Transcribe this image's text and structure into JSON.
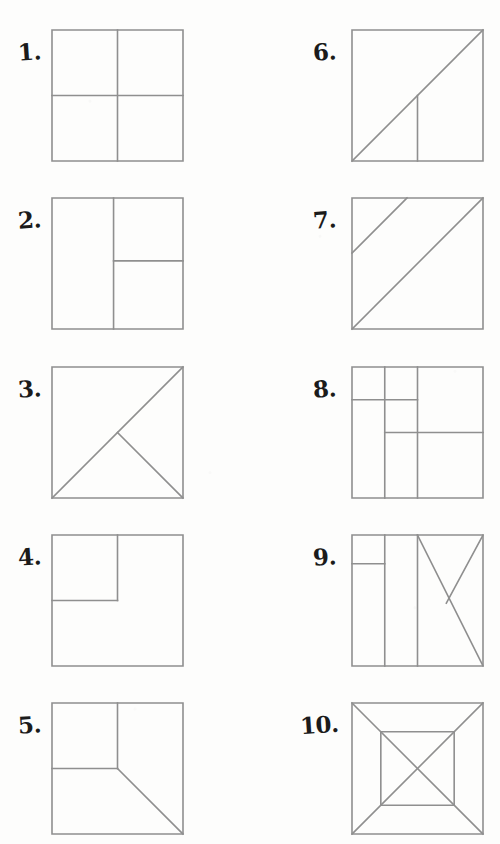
{
  "page": {
    "background_color": "#fdfdfc",
    "line_color": "#8f8f8f",
    "number_ink_color": "#1b1b1b",
    "width": 500,
    "height": 844
  },
  "layout": {
    "columns": 2,
    "rows": 5,
    "square_size": 131,
    "left_column_square_x": 52,
    "right_column_square_x": 352,
    "row_y_positions": [
      30,
      198,
      367,
      535,
      703
    ]
  },
  "problems": [
    {
      "number": "1.",
      "name": "square-quartered",
      "column": "left",
      "row": 0,
      "number_x": 18,
      "number_y": 40,
      "square": {
        "x": 52,
        "y": 30,
        "size": 131
      },
      "description": "Square divided into four equal quadrants",
      "lines": [
        {
          "name": "vertical-center",
          "x1": 50,
          "y1": 0,
          "x2": 50,
          "y2": 100
        },
        {
          "name": "horizontal-center",
          "x1": 0,
          "y1": 50,
          "x2": 100,
          "y2": 50
        }
      ]
    },
    {
      "number": "2.",
      "name": "square-left-half-right-split",
      "column": "left",
      "row": 1,
      "number_x": 18,
      "number_y": 208,
      "square": {
        "x": 52,
        "y": 198,
        "size": 131
      },
      "description": "Square with vertical line near center; right portion split horizontally",
      "lines": [
        {
          "name": "vertical-divider",
          "x1": 47,
          "y1": 0,
          "x2": 47,
          "y2": 100
        },
        {
          "name": "horizontal-right-half",
          "x1": 47,
          "y1": 48,
          "x2": 100,
          "y2": 48
        }
      ]
    },
    {
      "number": "3.",
      "name": "square-diagonal-with-triangle",
      "column": "left",
      "row": 2,
      "number_x": 18,
      "number_y": 377,
      "square": {
        "x": 52,
        "y": 367,
        "size": 131
      },
      "description": "Diagonal from bottom-left to top-right plus segment from its midpoint to bottom-right corner",
      "lines": [
        {
          "name": "main-diagonal",
          "x1": 0,
          "y1": 100,
          "x2": 100,
          "y2": 0
        },
        {
          "name": "midpoint-to-corner",
          "x1": 50,
          "y1": 50,
          "x2": 100,
          "y2": 100
        }
      ]
    },
    {
      "number": "4.",
      "name": "square-with-corner-square",
      "column": "left",
      "row": 3,
      "number_x": 18,
      "number_y": 545,
      "square": {
        "x": 52,
        "y": 535,
        "size": 131
      },
      "description": "Square with a smaller square drawn in the top-left corner",
      "lines": [
        {
          "name": "inner-square-right-edge",
          "x1": 50,
          "y1": 0,
          "x2": 50,
          "y2": 50
        },
        {
          "name": "inner-square-bottom-edge",
          "x1": 0,
          "y1": 50,
          "x2": 50,
          "y2": 50
        }
      ]
    },
    {
      "number": "5.",
      "name": "square-corner-square-and-diagonal",
      "column": "left",
      "row": 4,
      "number_x": 18,
      "number_y": 713,
      "square": {
        "x": 52,
        "y": 703,
        "size": 131
      },
      "description": "Top-left quarter square plus diagonal from center to bottom-right corner",
      "lines": [
        {
          "name": "inner-square-right-edge",
          "x1": 50,
          "y1": 0,
          "x2": 50,
          "y2": 50
        },
        {
          "name": "inner-square-bottom-edge",
          "x1": 0,
          "y1": 50,
          "x2": 50,
          "y2": 50
        },
        {
          "name": "center-to-bottom-right-diagonal",
          "x1": 50,
          "y1": 50,
          "x2": 100,
          "y2": 100
        }
      ]
    },
    {
      "number": "6.",
      "name": "square-diagonal-with-vertical",
      "column": "right",
      "row": 0,
      "number_x": 313,
      "number_y": 40,
      "square": {
        "x": 352,
        "y": 30,
        "size": 131
      },
      "description": "Diagonal from bottom-left to top-right plus vertical line from bottom edge up to the diagonal",
      "lines": [
        {
          "name": "main-diagonal",
          "x1": 0,
          "y1": 100,
          "x2": 100,
          "y2": 0
        },
        {
          "name": "vertical-to-diagonal",
          "x1": 50,
          "y1": 100,
          "x2": 50,
          "y2": 50
        }
      ]
    },
    {
      "number": "7.",
      "name": "square-two-parallel-diagonals",
      "column": "right",
      "row": 1,
      "number_x": 313,
      "number_y": 208,
      "square": {
        "x": 352,
        "y": 198,
        "size": 131
      },
      "description": "Main diagonal plus a shorter parallel diagonal in the upper-left region",
      "lines": [
        {
          "name": "main-diagonal",
          "x1": 0,
          "y1": 100,
          "x2": 100,
          "y2": 0
        },
        {
          "name": "parallel-diagonal",
          "x1": 0,
          "y1": 42,
          "x2": 42,
          "y2": 0
        }
      ]
    },
    {
      "number": "8.",
      "name": "square-nested-rectangles",
      "column": "right",
      "row": 2,
      "number_x": 313,
      "number_y": 377,
      "square": {
        "x": 352,
        "y": 367,
        "size": 131
      },
      "description": "Square with two vertical lines and two offset horizontal lines forming nested rectangles",
      "lines": [
        {
          "name": "vertical-quarter",
          "x1": 25,
          "y1": 0,
          "x2": 25,
          "y2": 100
        },
        {
          "name": "vertical-half",
          "x1": 50,
          "y1": 0,
          "x2": 50,
          "y2": 100
        },
        {
          "name": "horizontal-upper-left",
          "x1": 0,
          "y1": 25,
          "x2": 50,
          "y2": 25
        },
        {
          "name": "horizontal-mid-right",
          "x1": 25,
          "y1": 50,
          "x2": 100,
          "y2": 50
        }
      ]
    },
    {
      "number": "9.",
      "name": "square-columns-with-diagonals",
      "column": "right",
      "row": 3,
      "number_x": 313,
      "number_y": 545,
      "square": {
        "x": 352,
        "y": 535,
        "size": 131
      },
      "description": "Two vertical dividers, a short horizontal in the left column, and two diagonals in the right half forming an N shape",
      "lines": [
        {
          "name": "vertical-quarter",
          "x1": 25,
          "y1": 0,
          "x2": 25,
          "y2": 100
        },
        {
          "name": "vertical-half",
          "x1": 50,
          "y1": 0,
          "x2": 50,
          "y2": 100
        },
        {
          "name": "horizontal-left-column",
          "x1": 0,
          "y1": 22,
          "x2": 25,
          "y2": 22
        },
        {
          "name": "diagonal-descending",
          "x1": 50,
          "y1": 0,
          "x2": 100,
          "y2": 100
        },
        {
          "name": "diagonal-ascending-short",
          "x1": 100,
          "y1": 0,
          "x2": 72,
          "y2": 52
        }
      ]
    },
    {
      "number": "10.",
      "name": "square-nested-square-with-x",
      "column": "right",
      "row": 4,
      "number_x": 300,
      "number_y": 713,
      "square": {
        "x": 352,
        "y": 703,
        "size": 131
      },
      "description": "Outer square containing a concentric inner square with full corner-to-corner diagonals crossing through it",
      "inner_square": {
        "left": 22,
        "top": 22,
        "right": 78,
        "bottom": 78
      },
      "lines": [
        {
          "name": "inner-square-top",
          "x1": 22,
          "y1": 22,
          "x2": 78,
          "y2": 22
        },
        {
          "name": "inner-square-right",
          "x1": 78,
          "y1": 22,
          "x2": 78,
          "y2": 78
        },
        {
          "name": "inner-square-bottom",
          "x1": 22,
          "y1": 78,
          "x2": 78,
          "y2": 78
        },
        {
          "name": "inner-square-left",
          "x1": 22,
          "y1": 22,
          "x2": 22,
          "y2": 78
        },
        {
          "name": "diagonal-tl-br",
          "x1": 0,
          "y1": 0,
          "x2": 100,
          "y2": 100
        },
        {
          "name": "diagonal-tr-bl",
          "x1": 100,
          "y1": 0,
          "x2": 0,
          "y2": 100
        }
      ]
    }
  ]
}
